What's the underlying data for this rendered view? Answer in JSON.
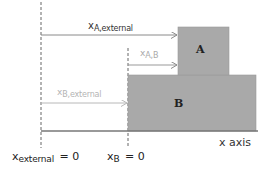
{
  "diagram": {
    "title": "",
    "colors": {
      "box_fill": "#a9a9a9",
      "box_border": "#9a9a9a",
      "axis_line": "#777777",
      "arrow_dark": "#8a8a8a",
      "arrow_light": "#b8b8b8",
      "text_dark": "#333333",
      "text_light": "#aaaaaa",
      "dashed_line": "#666666"
    },
    "boxes": [
      {
        "id": "A",
        "label": "A"
      },
      {
        "id": "B",
        "label": "B"
      }
    ],
    "arrows": [
      {
        "id": "x_A_external",
        "base": "x",
        "subscript": "A,external"
      },
      {
        "id": "x_A_B",
        "base": "x",
        "subscript": "A,B"
      },
      {
        "id": "x_B_external",
        "base": "x",
        "subscript": "B,external"
      }
    ],
    "axis": {
      "label": "x axis"
    },
    "origins": [
      {
        "id": "external",
        "base": "x",
        "subscript": "external",
        "equals": "= 0"
      },
      {
        "id": "B",
        "base": "x",
        "subscript": "B",
        "equals": "= 0"
      }
    ]
  }
}
